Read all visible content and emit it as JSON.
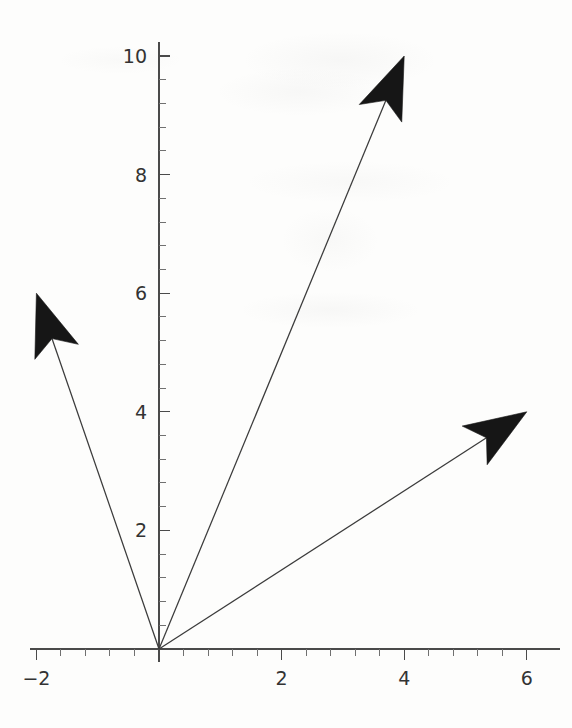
{
  "figure": {
    "title": "",
    "background_color": "#fdfdfc",
    "axis_color": "#4a4a4a",
    "vector_color": "#161616"
  },
  "chart_data": {
    "type": "scatter",
    "title": "",
    "xlabel": "",
    "ylabel": "",
    "grid": false,
    "legend": "none",
    "xlim": [
      -2.1,
      6.2
    ],
    "ylim": [
      -0.25,
      10.4
    ],
    "x_major_ticks": [
      -2,
      2,
      4,
      6
    ],
    "x_major_tick_labels": [
      "-2",
      "2",
      "4",
      "6"
    ],
    "x_minor_tick_step": 0.4,
    "y_major_ticks": [
      2,
      4,
      6,
      8,
      10
    ],
    "y_major_tick_labels": [
      "2",
      "4",
      "6",
      "8",
      "10"
    ],
    "y_minor_tick_step": 0.4,
    "series": [
      {
        "name": "vector-1",
        "type": "arrow",
        "origin": [
          0,
          0
        ],
        "tip": [
          -2,
          6
        ]
      },
      {
        "name": "vector-2",
        "type": "arrow",
        "origin": [
          0,
          0
        ],
        "tip": [
          4,
          10
        ]
      },
      {
        "name": "vector-3",
        "type": "arrow",
        "origin": [
          0,
          0
        ],
        "tip": [
          6,
          4
        ]
      }
    ]
  },
  "axes": {
    "x": {
      "labels": [
        {
          "text": "-2",
          "value": -2
        },
        {
          "text": "2",
          "value": 2
        },
        {
          "text": "4",
          "value": 4
        },
        {
          "text": "6",
          "value": 6
        }
      ]
    },
    "y": {
      "labels": [
        {
          "text": "2",
          "value": 2
        },
        {
          "text": "4",
          "value": 4
        },
        {
          "text": "6",
          "value": 6
        },
        {
          "text": "8",
          "value": 8
        },
        {
          "text": "10",
          "value": 10
        }
      ]
    }
  }
}
